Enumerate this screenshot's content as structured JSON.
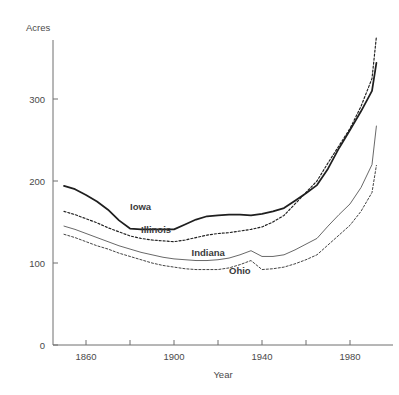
{
  "chart_data": {
    "type": "line",
    "title": "",
    "xlabel": "Year",
    "ylabel": "Acres",
    "xlim": [
      1845,
      1998
    ],
    "ylim": [
      0,
      360
    ],
    "grid": false,
    "legend_position": "inline-labels",
    "y_ticks": [
      0,
      100,
      200,
      300
    ],
    "y_ticklabels": [
      "0",
      "100",
      "200",
      "300"
    ],
    "x_ticks": [
      1860,
      1880,
      1900,
      1920,
      1940,
      1960,
      1980
    ],
    "x_ticklabels": [
      "1860",
      "",
      "1900",
      "",
      "1940",
      "",
      "1980"
    ],
    "x_major_labeled": [
      "1860",
      "1900",
      "1940",
      "1980"
    ],
    "series": [
      {
        "name": "Iowa",
        "style": "thick-solid",
        "label_x": 1880,
        "label_y": 168,
        "x": [
          1850,
          1855,
          1860,
          1865,
          1870,
          1875,
          1880,
          1885,
          1890,
          1895,
          1900,
          1905,
          1910,
          1915,
          1920,
          1925,
          1930,
          1935,
          1940,
          1945,
          1950,
          1955,
          1960,
          1965,
          1970,
          1975,
          1980,
          1985,
          1990,
          1992
        ],
        "y": [
          194,
          190,
          183,
          175,
          165,
          152,
          142,
          141,
          141,
          141,
          141,
          147,
          153,
          157,
          158,
          159,
          159,
          158,
          160,
          163,
          167,
          176,
          185,
          195,
          215,
          240,
          262,
          285,
          310,
          344
        ]
      },
      {
        "name": "Illinois",
        "style": "dashed",
        "label_x": 1885,
        "label_y": 140,
        "x": [
          1850,
          1855,
          1860,
          1865,
          1870,
          1875,
          1880,
          1885,
          1890,
          1895,
          1900,
          1905,
          1910,
          1915,
          1920,
          1925,
          1930,
          1935,
          1940,
          1945,
          1950,
          1955,
          1960,
          1965,
          1970,
          1975,
          1980,
          1985,
          1990,
          1992
        ],
        "y": [
          163,
          159,
          154,
          149,
          143,
          138,
          133,
          130,
          128,
          127,
          126,
          128,
          131,
          134,
          136,
          137,
          139,
          141,
          144,
          150,
          158,
          172,
          186,
          200,
          222,
          243,
          264,
          291,
          325,
          376
        ]
      },
      {
        "name": "Indiana",
        "style": "thin-solid",
        "label_x": 1908,
        "label_y": 112,
        "x": [
          1850,
          1855,
          1860,
          1865,
          1870,
          1875,
          1880,
          1885,
          1890,
          1895,
          1900,
          1905,
          1910,
          1915,
          1920,
          1925,
          1930,
          1935,
          1940,
          1945,
          1950,
          1955,
          1960,
          1965,
          1970,
          1975,
          1980,
          1985,
          1990,
          1992
        ],
        "y": [
          145,
          141,
          136,
          131,
          126,
          121,
          117,
          113,
          110,
          107,
          105,
          104,
          103,
          103,
          104,
          106,
          110,
          115,
          108,
          108,
          110,
          116,
          123,
          130,
          145,
          159,
          172,
          192,
          220,
          267
        ]
      },
      {
        "name": "Ohio",
        "style": "thin-dashed",
        "label_x": 1925,
        "label_y": 90,
        "x": [
          1850,
          1855,
          1860,
          1865,
          1870,
          1875,
          1880,
          1885,
          1890,
          1895,
          1900,
          1905,
          1910,
          1915,
          1920,
          1925,
          1930,
          1935,
          1940,
          1945,
          1950,
          1955,
          1960,
          1965,
          1970,
          1975,
          1980,
          1985,
          1990,
          1992
        ],
        "y": [
          135,
          131,
          126,
          121,
          117,
          112,
          108,
          104,
          100,
          97,
          95,
          93,
          92,
          92,
          92,
          94,
          98,
          103,
          92,
          93,
          95,
          99,
          104,
          110,
          122,
          134,
          146,
          163,
          186,
          219
        ]
      }
    ]
  }
}
